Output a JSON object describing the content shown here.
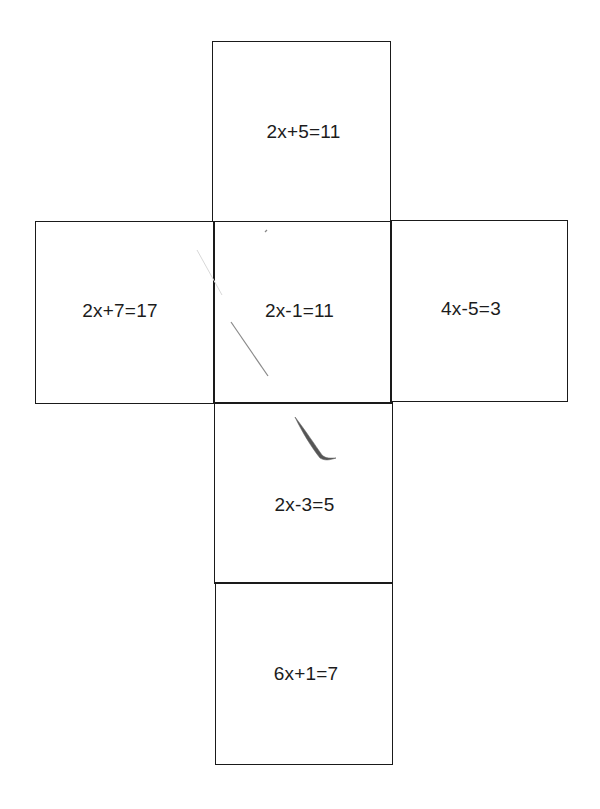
{
  "diagram": {
    "type": "cube-net",
    "faces": {
      "top": {
        "equation": "2x+5=11"
      },
      "left": {
        "equation": "2x+7=17"
      },
      "center": {
        "equation": "2x-1=11"
      },
      "right": {
        "equation": "4x-5=3"
      },
      "below": {
        "equation": "2x-3=5"
      },
      "bottom": {
        "equation": "6x+1=7"
      }
    },
    "colors": {
      "line": "#1a1a1a",
      "text": "#1c1c1c",
      "background": "#ffffff",
      "pencil_mark": "#6a6a6a"
    }
  }
}
